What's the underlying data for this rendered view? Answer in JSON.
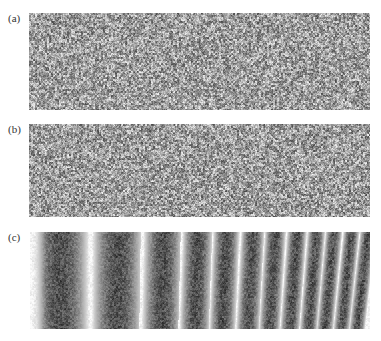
{
  "figure": {
    "panels": [
      {
        "label": "(a)",
        "type": "speckle",
        "description": "random speckle pattern",
        "box": {
          "x": 29,
          "y": 13,
          "w": 341,
          "h": 97
        },
        "label_pos": {
          "x": 8,
          "y": 12
        }
      },
      {
        "label": "(b)",
        "type": "speckle",
        "description": "random speckle pattern",
        "box": {
          "x": 29,
          "y": 124,
          "w": 341,
          "h": 93
        },
        "label_pos": {
          "x": 8,
          "y": 123
        }
      },
      {
        "label": "(c)",
        "type": "fringes",
        "description": "speckle correlation fringes with increasing spatial frequency",
        "box": {
          "x": 30,
          "y": 232,
          "w": 340,
          "h": 97
        },
        "label_pos": {
          "x": 8,
          "y": 231
        },
        "dark_band_centers_px": [
          60,
          117,
          162,
          196,
          224,
          250,
          272,
          293,
          312,
          329,
          346,
          362
        ]
      }
    ],
    "colors": {
      "background": "#ffffff",
      "dark": "#3a3a3a",
      "light": "#f2f2f2",
      "label": "#333333"
    }
  }
}
